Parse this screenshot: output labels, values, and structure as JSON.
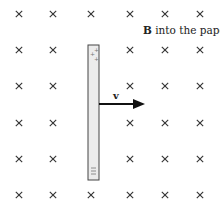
{
  "diagram": {
    "field_label_bold": "B",
    "field_label_rest": " into the paper",
    "velocity_label": "v",
    "rod_top_charges": [
      "+",
      "+",
      "+"
    ],
    "rod_bottom_charges": [
      "−",
      "−",
      "−"
    ],
    "field_symbol": "×",
    "grid": {
      "columns": [
        19,
        53,
        91,
        130,
        165,
        200
      ],
      "rows": [
        14,
        50,
        86,
        123,
        159,
        195
      ],
      "hidden_cells": [
        [
          1,
          2
        ],
        [
          2,
          2
        ],
        [
          3,
          2
        ],
        [
          4,
          2
        ]
      ]
    },
    "colors": {
      "cross": "#333333",
      "rod_fill": "#ececec",
      "rod_stroke": "#444444",
      "arrow": "#111111"
    }
  }
}
